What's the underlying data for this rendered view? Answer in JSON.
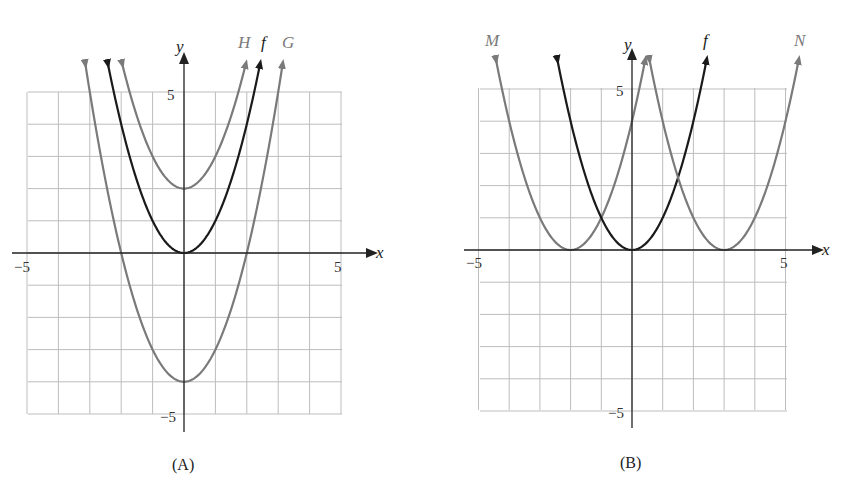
{
  "chart_data": [
    {
      "type": "line",
      "panel": "A",
      "caption": "(A)",
      "xlabel": "x",
      "ylabel": "y",
      "xlim": [
        -5,
        5
      ],
      "ylim": [
        -5,
        5
      ],
      "x_ticks_labeled": [
        "-5",
        "5"
      ],
      "y_ticks_labeled": [
        "5",
        "-5"
      ],
      "grid": true,
      "series": [
        {
          "name": "H",
          "equation": "y = x^2 + 2",
          "vertex": [
            0,
            2
          ],
          "color": "#7a7a7a"
        },
        {
          "name": "f",
          "equation": "y = x^2",
          "vertex": [
            0,
            0
          ],
          "color": "#1a1a1a"
        },
        {
          "name": "G",
          "equation": "y = x^2 - 4",
          "vertex": [
            0,
            -4
          ],
          "color": "#7a7a7a"
        }
      ]
    },
    {
      "type": "line",
      "panel": "B",
      "caption": "(B)",
      "xlabel": "x",
      "ylabel": "y",
      "xlim": [
        -5,
        5
      ],
      "ylim": [
        -5,
        5
      ],
      "x_ticks_labeled": [
        "-5",
        "5"
      ],
      "y_ticks_labeled": [
        "5",
        "-5"
      ],
      "grid": true,
      "series": [
        {
          "name": "M",
          "equation": "y = (x + 2)^2",
          "vertex": [
            -2,
            0
          ],
          "color": "#7a7a7a"
        },
        {
          "name": "f",
          "equation": "y = x^2",
          "vertex": [
            0,
            0
          ],
          "color": "#1a1a1a"
        },
        {
          "name": "N",
          "equation": "y = (x - 3)^2",
          "vertex": [
            3,
            0
          ],
          "color": "#7a7a7a"
        }
      ]
    }
  ],
  "panelA": {
    "caption": "(A)",
    "xlabel": "x",
    "ylabel": "y",
    "tick_xmin": "−5",
    "tick_xmax": "5",
    "tick_ymax": "5",
    "tick_ymin": "−5",
    "curve_labels": {
      "H": "H",
      "f": "f",
      "G": "G"
    }
  },
  "panelB": {
    "caption": "(B)",
    "xlabel": "x",
    "ylabel": "y",
    "tick_xmin": "−5",
    "tick_xmax": "5",
    "tick_ymax": "5",
    "tick_ymin": "−5",
    "curve_labels": {
      "M": "M",
      "f": "f",
      "N": "N"
    }
  },
  "colors": {
    "shifted_curve": "#7a7a7a",
    "base_curve": "#1a1a1a",
    "grid": "#bdbdbd"
  }
}
